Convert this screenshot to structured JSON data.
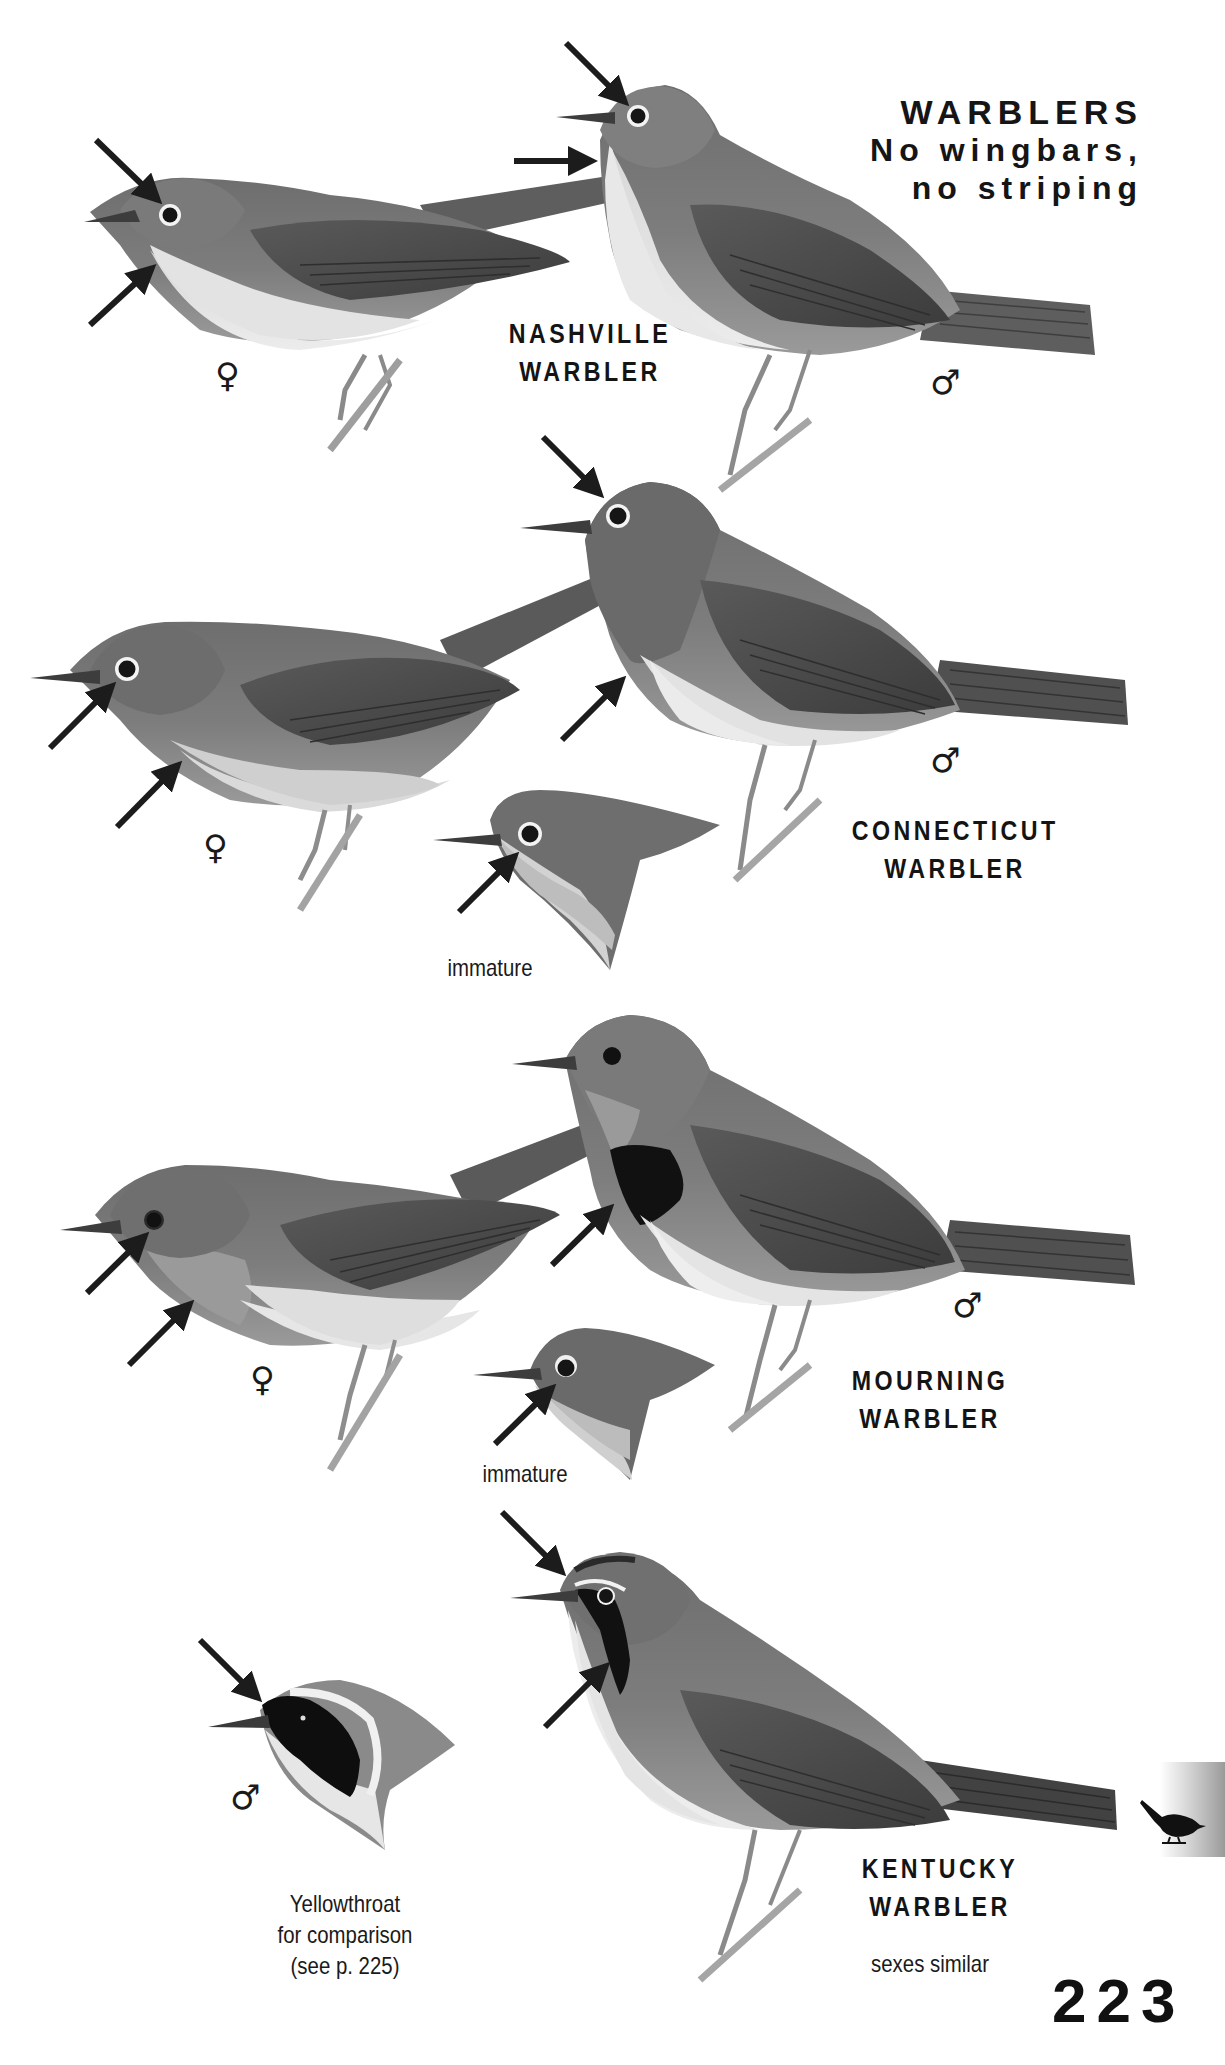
{
  "page": {
    "title": {
      "line1": "WARBLERS",
      "line2": "No wingbars,",
      "line3": "no striping"
    },
    "page_number": "223",
    "thumb_tab_icon": "bird-silhouette-icon"
  },
  "plates": [
    {
      "species_line1": "NASHVILLE",
      "species_line2": "WARBLER",
      "figures": [
        {
          "label": "female",
          "symbol": "♀"
        },
        {
          "label": "male",
          "symbol": "♂"
        }
      ]
    },
    {
      "species_line1": "CONNECTICUT",
      "species_line2": "WARBLER",
      "figures": [
        {
          "label": "female",
          "symbol": "♀"
        },
        {
          "label": "male",
          "symbol": "♂"
        },
        {
          "label": "immature",
          "caption": "immature"
        }
      ]
    },
    {
      "species_line1": "MOURNING",
      "species_line2": "WARBLER",
      "figures": [
        {
          "label": "female",
          "symbol": "♀"
        },
        {
          "label": "male",
          "symbol": "♂"
        },
        {
          "label": "immature",
          "caption": "immature"
        }
      ]
    },
    {
      "species_line1": "KENTUCKY",
      "species_line2": "WARBLER",
      "note": "sexes similar",
      "comparison": {
        "symbol": "♂",
        "line1": "Yellowthroat",
        "line2": "for comparison",
        "line3": "(see p. 225)"
      }
    }
  ]
}
